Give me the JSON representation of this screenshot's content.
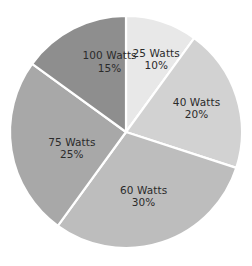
{
  "chart_data": {
    "type": "pie",
    "title": "",
    "subtitle": "",
    "xlabel": "",
    "ylabel": "",
    "legend_position": "none",
    "grid": false,
    "labels_inside_slices": true,
    "start_angle_deg": 0,
    "direction": "clockwise",
    "background_color": "#ffffff",
    "separator_color": "#ffffff",
    "label_text_color": "#2b2b2b",
    "categories": [
      "25 Watts",
      "40 Watts",
      "60 Watts",
      "75 Watts",
      "100 Watts"
    ],
    "values": [
      10,
      20,
      30,
      25,
      15
    ],
    "value_unit": "%",
    "colors": [
      "#e8e8e8",
      "#d2d2d2",
      "#bdbdbd",
      "#a8a8a8",
      "#8e8e8e"
    ],
    "slices": [
      {
        "name": "25 Watts",
        "percent_text": "10%",
        "value": 10,
        "color": "#e8e8e8",
        "start_deg": 0,
        "end_deg": 36,
        "label_x_pct": 62.0,
        "label_y_pct": 22.0
      },
      {
        "name": "40 Watts",
        "percent_text": "20%",
        "value": 20,
        "color": "#d2d2d2",
        "start_deg": 36,
        "end_deg": 108,
        "label_x_pct": 78.0,
        "label_y_pct": 40.5
      },
      {
        "name": "60 Watts",
        "percent_text": "30%",
        "value": 30,
        "color": "#bdbdbd",
        "start_deg": 108,
        "end_deg": 216,
        "label_x_pct": 57.0,
        "label_y_pct": 73.5
      },
      {
        "name": "75 Watts",
        "percent_text": "25%",
        "value": 25,
        "color": "#a8a8a8",
        "start_deg": 216,
        "end_deg": 306,
        "label_x_pct": 28.5,
        "label_y_pct": 55.5
      },
      {
        "name": "100 Watts",
        "percent_text": "15%",
        "value": 15,
        "color": "#8e8e8e",
        "start_deg": 306,
        "end_deg": 360,
        "label_x_pct": 43.5,
        "label_y_pct": 23.0
      }
    ],
    "geometry": {
      "center_x": 126,
      "center_y": 132,
      "radius": 116,
      "canvas_width": 252,
      "canvas_height": 266
    }
  }
}
